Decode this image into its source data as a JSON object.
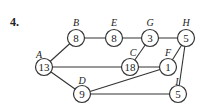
{
  "problem_number": "4.",
  "graph": {
    "nodes": [
      {
        "id": "A",
        "label": "A",
        "value": "13",
        "x": 44,
        "y": 67,
        "lx": 39,
        "ly": 54
      },
      {
        "id": "B",
        "label": "B",
        "value": "8",
        "x": 76,
        "y": 38,
        "lx": 76,
        "ly": 22
      },
      {
        "id": "E",
        "label": "E",
        "value": "8",
        "x": 114,
        "y": 38,
        "lx": 114,
        "ly": 22
      },
      {
        "id": "G",
        "label": "G",
        "value": "3",
        "x": 150,
        "y": 38,
        "lx": 150,
        "ly": 22
      },
      {
        "id": "H",
        "label": "H",
        "value": "5",
        "x": 186,
        "y": 38,
        "lx": 186,
        "ly": 22
      },
      {
        "id": "C",
        "label": "C",
        "value": "18",
        "x": 130,
        "y": 67,
        "lx": 133,
        "ly": 52
      },
      {
        "id": "F",
        "label": "F",
        "value": "1",
        "x": 168,
        "y": 67,
        "lx": 168,
        "ly": 52
      },
      {
        "id": "D",
        "label": "D",
        "value": "9",
        "x": 82,
        "y": 94,
        "lx": 82,
        "ly": 80
      },
      {
        "id": "I",
        "label": "I",
        "value": "5",
        "x": 178,
        "y": 94,
        "lx": 177,
        "ly": 81
      }
    ],
    "edges": [
      [
        "A",
        "B"
      ],
      [
        "B",
        "E"
      ],
      [
        "E",
        "G"
      ],
      [
        "G",
        "H"
      ],
      [
        "G",
        "C"
      ],
      [
        "A",
        "C"
      ],
      [
        "C",
        "F"
      ],
      [
        "F",
        "H"
      ],
      [
        "H",
        "I"
      ],
      [
        "A",
        "D"
      ],
      [
        "D",
        "F"
      ],
      [
        "D",
        "I"
      ]
    ]
  }
}
